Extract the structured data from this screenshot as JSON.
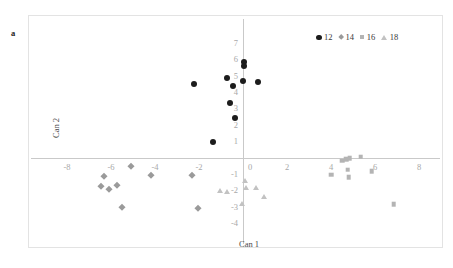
{
  "panel": {
    "label": "a"
  },
  "legend": {
    "position": "top-right",
    "entries": [
      {
        "label": "12",
        "marker": "circle-marker-icon",
        "color": "#1c1c1c"
      },
      {
        "label": "14",
        "marker": "diamond-marker-icon",
        "color": "#9a9a9a"
      },
      {
        "label": "16",
        "marker": "square-marker-icon",
        "color": "#b4b4b4"
      },
      {
        "label": "18",
        "marker": "triangle-marker-icon",
        "color": "#c2c2c2"
      }
    ]
  },
  "axes": {
    "x_title": "Can 1",
    "y_title": "Can 2",
    "x_ticks": [
      "-8",
      "-6",
      "-4",
      "-2",
      "0",
      "2",
      "4",
      "6",
      "8"
    ],
    "y_ticks": [
      "7",
      "6",
      "5",
      "4",
      "3",
      "2",
      "1",
      "0",
      "-1",
      "-2",
      "-3",
      "-4"
    ],
    "axis_color": "#c9c9c9",
    "tick_color": "#a8a8a8"
  },
  "chart_data": {
    "type": "scatter",
    "title": "",
    "subtitle": "",
    "xlabel": "Can 1",
    "ylabel": "Can 2",
    "xlim": [
      -9,
      9
    ],
    "ylim": [
      -4.6,
      7.4
    ],
    "grid": false,
    "legend_position": "top-right",
    "xticks": [
      -8,
      -6,
      -4,
      -2,
      0,
      2,
      4,
      6,
      8
    ],
    "yticks": [
      7,
      6,
      5,
      4,
      3,
      2,
      1,
      0,
      -1,
      -2,
      -3,
      -4
    ],
    "annotations": [
      "a"
    ],
    "series": [
      {
        "name": "12",
        "marker": "circle",
        "color": "#1c1c1c",
        "points": [
          [
            0.05,
            5.85
          ],
          [
            0.05,
            5.6
          ],
          [
            -0.75,
            4.85
          ],
          [
            -2.25,
            4.5
          ],
          [
            -0.45,
            4.35
          ],
          [
            0.0,
            4.7
          ],
          [
            0.7,
            4.6
          ],
          [
            -0.6,
            3.35
          ],
          [
            -0.35,
            2.4
          ],
          [
            -1.35,
            0.95
          ]
        ]
      },
      {
        "name": "14",
        "marker": "diamond",
        "color": "#9a9a9a",
        "points": [
          [
            -6.3,
            -1.15
          ],
          [
            -6.45,
            -1.75
          ],
          [
            -6.1,
            -1.9
          ],
          [
            -5.75,
            -1.7
          ],
          [
            -5.1,
            -0.55
          ],
          [
            -4.2,
            -1.1
          ],
          [
            -2.3,
            -1.05
          ],
          [
            -5.5,
            -3.0
          ],
          [
            -2.05,
            -3.1
          ]
        ]
      },
      {
        "name": "16",
        "marker": "square",
        "color": "#b4b4b4",
        "points": [
          [
            4.5,
            -0.2
          ],
          [
            4.7,
            -0.1
          ],
          [
            4.85,
            -0.05
          ],
          [
            5.35,
            0.05
          ],
          [
            4.0,
            -1.05
          ],
          [
            4.75,
            -0.75
          ],
          [
            4.8,
            -1.2
          ],
          [
            5.85,
            -0.85
          ],
          [
            6.85,
            -2.85
          ]
        ]
      },
      {
        "name": "18",
        "marker": "triangle",
        "color": "#c2c2c2",
        "points": [
          [
            0.1,
            -1.4
          ],
          [
            -1.05,
            -2.0
          ],
          [
            -0.75,
            -2.1
          ],
          [
            0.15,
            -1.85
          ],
          [
            0.6,
            -1.85
          ],
          [
            0.95,
            -2.4
          ],
          [
            -0.05,
            -2.85
          ]
        ]
      }
    ]
  }
}
